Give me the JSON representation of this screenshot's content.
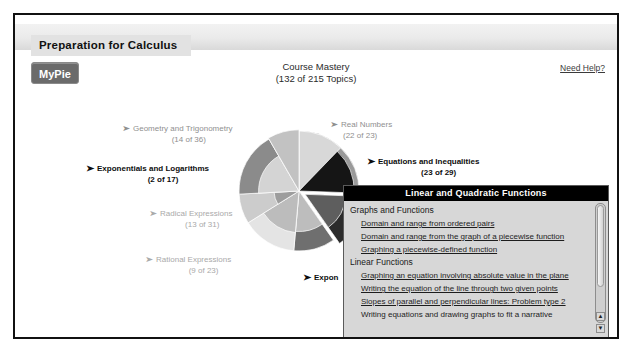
{
  "header": {
    "course_title": "Preparation for Calculus"
  },
  "toolbar": {
    "mypie_label": "MyPie",
    "mastery_title": "Course Mastery",
    "mastery_count": "(132 of 215 Topics)",
    "need_help_label": "Need Help?"
  },
  "arrow_glyph": "➤",
  "pie_labels": [
    {
      "id": "geometry",
      "name": "Geometry and Trigonometry",
      "count": "(14 of 36)",
      "style": "mid"
    },
    {
      "id": "exponentials",
      "name": "Exponentials and Logarithms",
      "count": "(2 of 17)",
      "style": "bold"
    },
    {
      "id": "radical",
      "name": "Radical Expressions",
      "count": "(13 of 31)",
      "style": "dim"
    },
    {
      "id": "rational",
      "name": "Rational Expressions",
      "count": "(9 of 23)",
      "style": "dim"
    },
    {
      "id": "realnumbers",
      "name": "Real Numbers",
      "count": "(22 of 23)",
      "style": "mid"
    },
    {
      "id": "equations",
      "name": "Equations and Inequalities",
      "count": "(23 of 29)",
      "style": "bold"
    },
    {
      "id": "exponential_fn",
      "name": "Expon",
      "count": "",
      "style": "bold"
    }
  ],
  "popup": {
    "title": "Linear and Quadratic Functions",
    "sections": [
      {
        "heading": "Graphs and Functions",
        "items": [
          {
            "label": "Domain and range from ordered pairs",
            "link": true
          },
          {
            "label": "Domain and range from the graph of a piecewise function",
            "link": true
          },
          {
            "label": "Graphing a piecewise-defined function",
            "link": true
          }
        ]
      },
      {
        "heading": "Linear Functions",
        "items": [
          {
            "label": "Graphing an equation involving absolute value in the plane",
            "link": true
          },
          {
            "label": "Writing the equation of the line through two given points",
            "link": true
          },
          {
            "label": "Slopes of parallel and perpendicular lines: Problem type 2",
            "link": true
          },
          {
            "label": "Writing equations and drawing graphs to fit a narrative",
            "link": false
          }
        ]
      }
    ],
    "scroll_up_glyph": "▲",
    "scroll_down_glyph": "▼"
  },
  "chart_data": {
    "type": "pie",
    "title": "Course Mastery",
    "subtitle": "(132 of 215 Topics)",
    "total_topics": 215,
    "completed_topics": 132,
    "legend_position": "around-chart",
    "categories": [
      "Real Numbers",
      "Equations and Inequalities",
      "Exponential Functions",
      "Rational Expressions",
      "Radical Expressions",
      "Exponentials and Logarithms",
      "Geometry and Trigonometry"
    ],
    "values": [
      23,
      29,
      31,
      23,
      31,
      17,
      36
    ],
    "completed": [
      22,
      23,
      12,
      9,
      13,
      2,
      14
    ],
    "slices": [
      {
        "label": "Real Numbers",
        "total": 23,
        "done": 22,
        "start_deg": 0,
        "end_deg": 44,
        "color": "#8e8e8e",
        "done_color": "#d8d8d8",
        "exploded": false
      },
      {
        "label": "Equations and Inequalities",
        "total": 29,
        "done": 23,
        "start_deg": 44,
        "end_deg": 92,
        "color": "#9a9a9a",
        "done_color": "#151515",
        "exploded": false
      },
      {
        "label": "Exponential Functions",
        "total": 31,
        "done": 12,
        "start_deg": 92,
        "end_deg": 145,
        "color": "#2b2b2b",
        "done_color": "#5e5e5e",
        "exploded": true
      },
      {
        "label": "Rational Expressions",
        "total": 23,
        "done": 9,
        "start_deg": 145,
        "end_deg": 185,
        "color": "#6f6f6f",
        "done_color": "#bdbdbd",
        "exploded": false
      },
      {
        "label": "Radical Expressions",
        "total": 31,
        "done": 13,
        "start_deg": 185,
        "end_deg": 238,
        "color": "#e4e4e4",
        "done_color": "#bcbcbc",
        "exploded": false
      },
      {
        "label": "Exponentials and Logarithms",
        "total": 17,
        "done": 2,
        "start_deg": 238,
        "end_deg": 267,
        "color": "#cccccc",
        "done_color": "#9d9d9d",
        "exploded": false
      },
      {
        "label": "Geometry and Trigonometry",
        "total": 36,
        "done": 14,
        "start_deg": 267,
        "end_deg": 330,
        "color": "#8b8b8b",
        "done_color": "#d4d4d4",
        "exploded": false
      },
      {
        "label": "Other",
        "total": 25,
        "done": 37,
        "start_deg": 330,
        "end_deg": 360,
        "color": "#dcdcdc",
        "done_color": "#c2c2c2",
        "exploded": false
      }
    ],
    "colors": {
      "accent_dark": "#151515",
      "ring_mid": "#8e8e8e",
      "ring_light": "#e4e4e4"
    }
  }
}
